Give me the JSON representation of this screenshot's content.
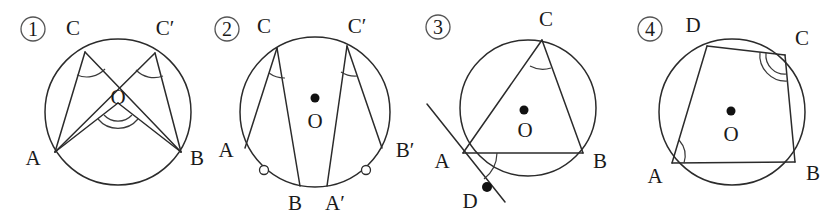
{
  "page": {
    "width": 835,
    "height": 217,
    "background_color": "#ffffff",
    "ink_color": "#2b2b2b"
  },
  "figures": [
    {
      "number": "①",
      "number_plain": "1",
      "caption": "",
      "center_label": "O",
      "has_center_dot": false,
      "points": [
        {
          "label": "A",
          "role": "chord-endpoint"
        },
        {
          "label": "B",
          "role": "chord-endpoint"
        },
        {
          "label": "C",
          "role": "inscribed-vertex"
        },
        {
          "label": "C′",
          "role": "inscribed-vertex"
        }
      ],
      "angle_marks": [
        {
          "at": "C",
          "style": "single-arc"
        },
        {
          "at": "C′",
          "style": "single-arc"
        },
        {
          "at": "O",
          "style": "double-arc"
        }
      ],
      "tick_marks": [],
      "tangent_line": false
    },
    {
      "number": "②",
      "number_plain": "2",
      "caption": "",
      "center_label": "O",
      "has_center_dot": true,
      "points": [
        {
          "label": "A",
          "role": "chord-endpoint"
        },
        {
          "label": "B",
          "role": "chord-endpoint"
        },
        {
          "label": "C",
          "role": "inscribed-vertex"
        },
        {
          "label": "A′",
          "role": "chord-endpoint"
        },
        {
          "label": "B′",
          "role": "chord-endpoint"
        },
        {
          "label": "C′",
          "role": "inscribed-vertex"
        }
      ],
      "angle_marks": [
        {
          "at": "C",
          "style": "single-arc"
        },
        {
          "at": "C′",
          "style": "single-arc"
        }
      ],
      "tick_marks": [
        {
          "on": "arc AB",
          "style": "hollow-circle"
        },
        {
          "on": "arc A′B′",
          "style": "hollow-circle"
        }
      ],
      "tangent_line": false
    },
    {
      "number": "③",
      "number_plain": "3",
      "caption": "",
      "center_label": "O",
      "has_center_dot": true,
      "points": [
        {
          "label": "A",
          "role": "tangent-point"
        },
        {
          "label": "B",
          "role": "chord-endpoint"
        },
        {
          "label": "C",
          "role": "inscribed-vertex"
        },
        {
          "label": "D",
          "role": "tangent-line-point"
        }
      ],
      "angle_marks": [
        {
          "at": "C",
          "style": "single-arc"
        },
        {
          "at": "A",
          "style": "single-arc"
        }
      ],
      "tick_marks": [
        {
          "on": "point D",
          "style": "filled-dot"
        }
      ],
      "tangent_line": true
    },
    {
      "number": "④",
      "number_plain": "4",
      "caption": "",
      "center_label": "O",
      "has_center_dot": true,
      "points": [
        {
          "label": "A",
          "role": "quad-vertex"
        },
        {
          "label": "B",
          "role": "quad-vertex"
        },
        {
          "label": "C",
          "role": "quad-vertex"
        },
        {
          "label": "D",
          "role": "quad-vertex"
        }
      ],
      "angle_marks": [
        {
          "at": "A",
          "style": "single-arc"
        },
        {
          "at": "C",
          "style": "double-arc"
        }
      ],
      "tick_marks": [],
      "tangent_line": false
    }
  ]
}
